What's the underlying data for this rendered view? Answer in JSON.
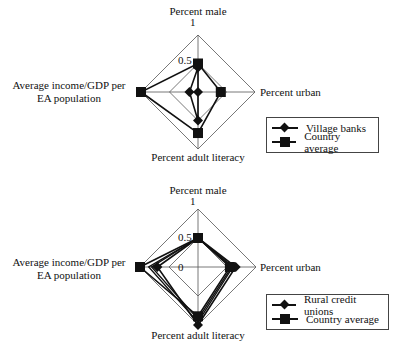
{
  "chart_data": [
    {
      "type": "radar",
      "title": "",
      "axes": [
        "Percent male",
        "Percent urban",
        "Percent adult literacy",
        "Average income/GDP per EA population"
      ],
      "axis_labels": {
        "top": "Percent male",
        "right": "Percent urban",
        "bottom": "Percent adult literacy",
        "left_line1": "Average income/GDP per",
        "left_line2": "EA population"
      },
      "tick_labels": [
        "0",
        "0.5",
        "1"
      ],
      "range": [
        0,
        1
      ],
      "grid_rings": [
        0.5,
        1.0
      ],
      "legend_position": "lower right",
      "series": [
        {
          "name": "Village banks",
          "marker": "diamond",
          "values": {
            "Percent male": 0.43,
            "Percent urban": 0.0,
            "Percent adult literacy": 0.5,
            "Average income/GDP per EA population": 0.15
          }
        },
        {
          "name": "Country average",
          "marker": "square",
          "values": {
            "Percent male": 0.5,
            "Percent urban": 0.4,
            "Percent adult literacy": 0.72,
            "Average income/GDP per EA population": 1.0
          }
        }
      ]
    },
    {
      "type": "radar",
      "title": "",
      "axes": [
        "Percent male",
        "Percent urban",
        "Percent adult literacy",
        "Average income/GDP per EA population"
      ],
      "axis_labels": {
        "top": "Percent male",
        "right": "Percent urban",
        "bottom": "Percent adult literacy",
        "left_line1": "Average income/GDP per",
        "left_line2": "EA population"
      },
      "tick_labels": [
        "0",
        "0.5",
        "1"
      ],
      "range": [
        0,
        1
      ],
      "grid_rings": [
        0.5,
        1.0
      ],
      "legend_position": "lower right",
      "series": [
        {
          "name": "Rural credit unions",
          "marker": "diamond",
          "values": {
            "Percent male": 0.5,
            "Percent urban": 0.65,
            "Percent adult literacy": 1.0,
            "Average income/GDP per EA population": 0.7
          }
        },
        {
          "name": "Country average",
          "marker": "square",
          "values": {
            "Percent male": 0.5,
            "Percent urban": 0.55,
            "Percent adult literacy": 0.85,
            "Average income/GDP per EA population": 1.0
          }
        }
      ],
      "extra_lines": [
        {
          "values": {
            "Percent male": 0.5,
            "Percent urban": 0.6,
            "Percent adult literacy": 0.95,
            "Average income/GDP per EA population": 0.85
          }
        },
        {
          "values": {
            "Percent male": 0.5,
            "Percent urban": 0.58,
            "Percent adult literacy": 0.9,
            "Average income/GDP per EA population": 0.8
          }
        }
      ]
    }
  ],
  "legends": [
    {
      "items": [
        {
          "label": "Village banks",
          "marker": "diamond"
        },
        {
          "label": "Country average",
          "marker": "square"
        }
      ]
    },
    {
      "items": [
        {
          "label": "Rural credit unions",
          "marker": "diamond"
        },
        {
          "label": "Country average",
          "marker": "square"
        }
      ]
    }
  ],
  "colors": {
    "line": "#111111",
    "grid": "#555555"
  }
}
